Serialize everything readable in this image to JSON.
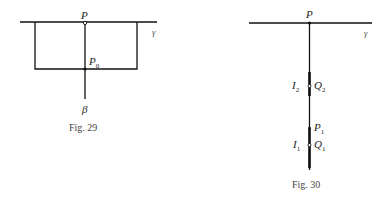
{
  "figures": [
    {
      "caption": "Fig. 29",
      "labels": {
        "P": "P",
        "P0_base": "P",
        "P0_sub": "0",
        "gamma": "γ",
        "beta": "β"
      }
    },
    {
      "caption": "Fig. 30",
      "labels": {
        "P": "P",
        "gamma": "γ",
        "I2_base": "I",
        "I2_sub": "2",
        "Q2_base": "Q",
        "Q2_sub": "2",
        "P1_base": "P",
        "P1_sub": "1",
        "I1_base": "I",
        "I1_sub": "1",
        "Q1_base": "Q",
        "Q1_sub": "1"
      }
    }
  ],
  "colors": {
    "line": "#111111",
    "text": "#222222"
  }
}
